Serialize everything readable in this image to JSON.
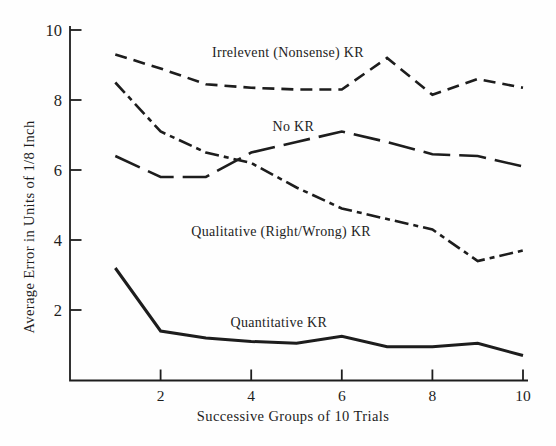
{
  "colors": {
    "ink": "#1d1d1d",
    "background": "#fefefe"
  },
  "chart_data": {
    "type": "line",
    "title": "",
    "xlabel": "Successive Groups of 10 Trials",
    "ylabel": "Average Error in Units of 1/8 Inch",
    "x": [
      1,
      2,
      3,
      4,
      5,
      6,
      7,
      8,
      9,
      10
    ],
    "xlim": [
      0,
      10
    ],
    "ylim": [
      0,
      10
    ],
    "xticks": [
      2,
      4,
      6,
      8,
      10
    ],
    "yticks": [
      2,
      4,
      6,
      8,
      10
    ],
    "grid": false,
    "legend": "inline-labels",
    "series": [
      {
        "id": "irrelevant-nonsense-kr",
        "name": "Irrelevent (Nonsense) KR",
        "line_style": "dashed",
        "dash": "12 7",
        "stroke_width": 2.6,
        "values": [
          9.3,
          8.9,
          8.45,
          8.35,
          8.3,
          8.3,
          9.2,
          8.15,
          8.6,
          8.35
        ],
        "label_pos": {
          "x": 4.81,
          "y": 9.22
        }
      },
      {
        "id": "no-kr",
        "name": "No KR",
        "line_style": "long-dash",
        "dash": "27 9",
        "stroke_width": 2.6,
        "values": [
          6.4,
          5.8,
          5.8,
          6.5,
          6.8,
          7.1,
          6.8,
          6.45,
          6.4,
          6.1
        ],
        "label_pos": {
          "x": 4.93,
          "y": 7.11
        }
      },
      {
        "id": "qualitative-kr",
        "name": "Qualitative (Right/Wrong) KR",
        "line_style": "dash-dot",
        "dash": "14 5 5 5",
        "stroke_width": 2.6,
        "values": [
          8.5,
          7.1,
          6.5,
          6.2,
          5.5,
          4.9,
          4.6,
          4.3,
          3.4,
          3.7
        ],
        "label_pos": {
          "x": 4.66,
          "y": 4.11
        }
      },
      {
        "id": "quantitative-kr",
        "name": "Quantitative KR",
        "line_style": "solid",
        "dash": "",
        "stroke_width": 3,
        "values": [
          3.2,
          1.4,
          1.2,
          1.1,
          1.05,
          1.25,
          0.95,
          0.95,
          1.05,
          0.7
        ],
        "label_pos": {
          "x": 4.61,
          "y": 1.51
        }
      }
    ]
  }
}
